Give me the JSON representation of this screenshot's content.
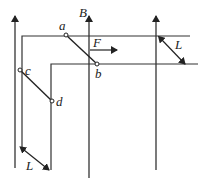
{
  "diagram": {
    "type": "physics-circuit",
    "labels": {
      "field": "B",
      "rod1_top": "a",
      "rod1_bottom": "b",
      "rod2_top": "c",
      "rod2_bottom": "d",
      "force": "F",
      "width_right": "L",
      "width_bottom": "L"
    },
    "colors": {
      "line": "#222222",
      "background": "#ffffff"
    }
  }
}
